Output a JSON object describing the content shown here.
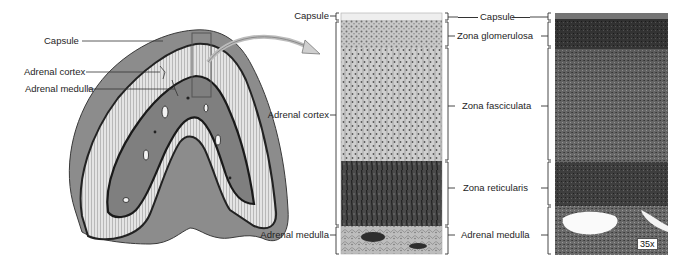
{
  "figure": {
    "gland_illustration": {
      "labels": {
        "capsule": "Capsule",
        "adrenal_cortex": "Adrenal cortex",
        "adrenal_medulla": "Adrenal medulla"
      }
    },
    "section_illustration": {
      "labels": {
        "capsule": "Capsule",
        "adrenal_cortex": "Adrenal cortex",
        "adrenal_medulla": "Adrenal medulla"
      }
    },
    "zone_labels": {
      "capsule": "Capsule",
      "zona_glomerulosa": "Zona glomerulosa",
      "zona_fasciculata": "Zona fasciculata",
      "zona_reticularis": "Zona reticularis",
      "adrenal_medulla": "Adrenal medulla"
    },
    "micrograph": {
      "magnification": "35x"
    },
    "colors": {
      "outline": "#2a2a2a",
      "capsule_fill": "#8a8a8a",
      "cortex_fill": "#d9d9d9",
      "medulla_fill": "#7d7d7d",
      "reticularis_fill": "#3d3d3d",
      "micrograph_fill": "#5a5a5a"
    }
  }
}
